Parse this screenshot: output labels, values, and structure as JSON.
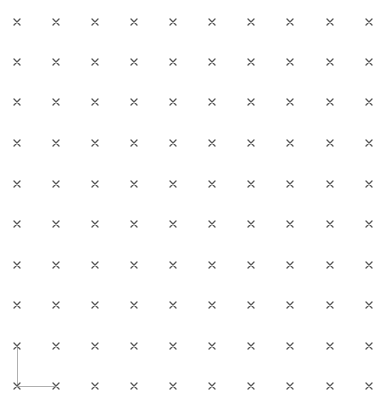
{
  "grid": {
    "columns": [
      17,
      56,
      95,
      134,
      173,
      212,
      251,
      290,
      330,
      369
    ],
    "rows": [
      22,
      62,
      102,
      143,
      184,
      224,
      265,
      305,
      346,
      386
    ],
    "marker": "x-mark-icon",
    "marker_color": "#555555"
  },
  "axes": {
    "origin": [
      17,
      386
    ],
    "x_end": 56,
    "y_end": 346,
    "color": "#b0b0b0"
  }
}
